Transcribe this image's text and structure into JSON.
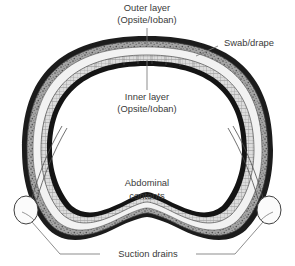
{
  "figure": {
    "background_color": "#ffffff",
    "width": 295,
    "height": 266
  },
  "labels": {
    "outer_layer_line1": "Outer layer",
    "outer_layer_line2": "(Opsite/Ioban)",
    "inner_layer_line1": "Inner layer",
    "inner_layer_line2": "(Opsite/Ioban)",
    "swab_drape": "Swab/drape",
    "abdominal_contents_line1": "Abdominal",
    "abdominal_contents_line2": "contents",
    "suction_drains": "Suction drains"
  },
  "colors": {
    "text": "#3a3a3a",
    "leader_line": "#6f6f6f",
    "outer_dark_layer": "#1c1c1c",
    "stipple_band": "#9a9a9a",
    "swab_band": "#d8d8d8",
    "inner_dark_line": "#141414",
    "cavity_fill": "#ffffff",
    "drain_outline": "#555555",
    "drain_bulb_fill": "#fbfbfb"
  },
  "structures": {
    "outer_layer_name": "outer-opsite-ioban-layer",
    "stipple_layer_name": "stipple-fascia-band",
    "swab_layer_name": "swab-drape-band",
    "inner_layer_name": "inner-opsite-ioban-layer",
    "cavity_name": "abdominal-cavity",
    "left_drain_name": "left-suction-drain",
    "right_drain_name": "right-suction-drain"
  }
}
